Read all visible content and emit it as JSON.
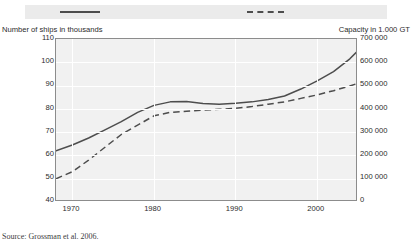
{
  "figure": {
    "clipped_header": "Development of world merchant fleet",
    "source": "Source:  Grossman et al. 2006."
  },
  "legend": {
    "items": [
      {
        "name": "number-of-ships",
        "style": "solid",
        "label": ""
      },
      {
        "name": "capacity",
        "style": "dashed",
        "label": ""
      }
    ]
  },
  "axes": {
    "left_title": "Number of ships in thousands",
    "right_title": "Capacity in 1.000 GT",
    "left_ticks": [
      "110",
      "100",
      "90",
      "80",
      "70",
      "60",
      "50",
      "40"
    ],
    "right_ticks": [
      "700 000",
      "600 000",
      "500 000",
      "400 000",
      "300 000",
      "200 000",
      "100 000",
      "0"
    ],
    "x_ticks": [
      "1970",
      "1980",
      "1990",
      "2000"
    ]
  },
  "chart_data": {
    "type": "line",
    "title": "",
    "xlabel": "",
    "ylabel": "Number of ships in thousands",
    "y2label": "Capacity in 1.000 GT",
    "xlim": [
      1968,
      2005
    ],
    "ylim": [
      40,
      110
    ],
    "y2lim": [
      0,
      700000
    ],
    "grid": true,
    "legend_position": "top",
    "series": [
      {
        "name": "Number of ships in thousands",
        "axis": "left",
        "style": "solid",
        "color": "#4d4d4d",
        "x": [
          1968,
          1970,
          1972,
          1974,
          1976,
          1978,
          1980,
          1982,
          1984,
          1986,
          1988,
          1990,
          1992,
          1994,
          1996,
          1998,
          2000,
          2002,
          2004,
          2005
        ],
        "y": [
          62.0,
          64.5,
          67.5,
          71.0,
          74.5,
          78.5,
          81.5,
          83.0,
          83.2,
          82.3,
          82.0,
          82.4,
          83.0,
          84.0,
          85.5,
          88.5,
          92.0,
          96.0,
          101.5,
          105.0
        ]
      },
      {
        "name": "Capacity in 1.000 GT",
        "axis": "right",
        "style": "dashed",
        "color": "#4d4d4d",
        "x": [
          1968,
          1970,
          1972,
          1974,
          1976,
          1978,
          1980,
          1982,
          1984,
          1986,
          1988,
          1990,
          1992,
          1994,
          1996,
          1998,
          2000,
          2002,
          2004,
          2005
        ],
        "y": [
          100000,
          130000,
          180000,
          235000,
          290000,
          330000,
          370000,
          385000,
          390000,
          395000,
          398000,
          402000,
          410000,
          420000,
          430000,
          445000,
          460000,
          478000,
          498000,
          510000
        ],
        "y_left_equivalent": [
          50.0,
          53.0,
          58.0,
          63.5,
          69.0,
          73.0,
          77.0,
          78.5,
          79.0,
          79.5,
          79.8,
          80.2,
          81.0,
          82.0,
          83.0,
          84.5,
          86.0,
          87.8,
          89.8,
          91.0
        ]
      }
    ]
  }
}
